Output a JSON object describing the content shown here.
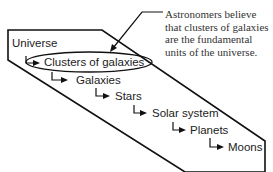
{
  "diagram": {
    "hierarchy": [
      {
        "label": "Universe",
        "level": 0
      },
      {
        "label": "Clusters of galaxies",
        "level": 1,
        "highlighted": true
      },
      {
        "label": "Galaxies",
        "level": 2
      },
      {
        "label": "Stars",
        "level": 3
      },
      {
        "label": "Solar system",
        "level": 4
      },
      {
        "label": "Planets",
        "level": 5
      },
      {
        "label": "Moons",
        "level": 6
      }
    ],
    "annotation": {
      "lines": [
        "Astronomers believe",
        "that clusters of galaxies",
        "are the fundamental",
        "units of the universe."
      ]
    }
  }
}
